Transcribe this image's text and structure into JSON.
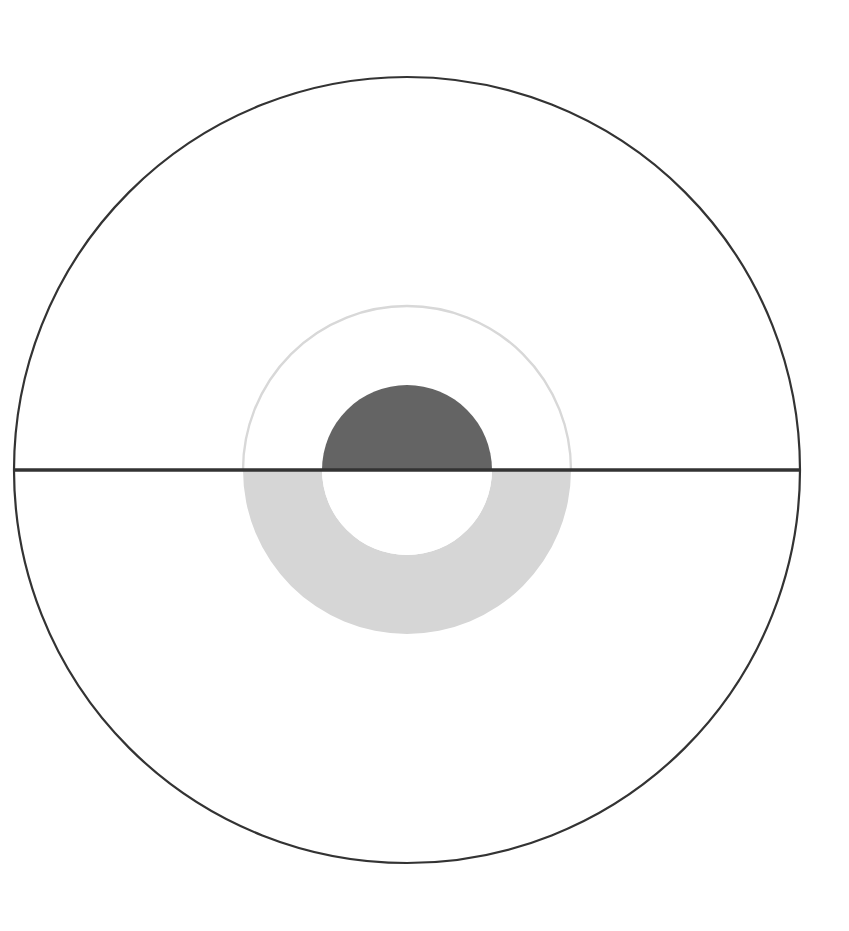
{
  "canvas": {
    "width": 849,
    "height": 931,
    "background": "#ffffff",
    "title": "Concentric circles with half-filled donut"
  },
  "chart_data": {
    "type": "pie",
    "title": "",
    "subtitle": "",
    "xlabel": "",
    "ylabel": "",
    "legend": [],
    "annotations": [],
    "grid": false,
    "center": {
      "x": 407,
      "y": 470
    },
    "series": [
      {
        "name": "outer-circle",
        "role": "outline",
        "radius": 393,
        "fill": "none",
        "stroke": "#333333",
        "stroke_width": 2.2,
        "half": "full"
      },
      {
        "name": "middle-circle-upper-outline",
        "role": "outline",
        "radius": 164,
        "fill": "none",
        "stroke": "#d8d8d8",
        "stroke_width": 2.4,
        "half": "upper"
      },
      {
        "name": "middle-annulus-lower-fill",
        "role": "fill",
        "outer_radius": 164,
        "inner_radius": 85,
        "fill": "#d6d6d6",
        "stroke": "none",
        "half": "lower"
      },
      {
        "name": "inner-circle-upper-fill",
        "role": "fill",
        "radius": 85,
        "fill": "#646464",
        "stroke": "none",
        "half": "upper"
      },
      {
        "name": "inner-circle-lower-hole",
        "role": "fill",
        "radius": 85,
        "fill": "#ffffff",
        "stroke": "none",
        "half": "lower"
      }
    ],
    "diameter_line": {
      "name": "horizontal-diameter",
      "x1": 14,
      "x2": 800,
      "y": 470,
      "stroke": "#333333",
      "stroke_width": 3.4
    },
    "values": [],
    "categories": []
  },
  "colors": {
    "outline_dark": "#333333",
    "fill_dark": "#646464",
    "fill_light": "#d6d6d6",
    "outline_light": "#d8d8d8",
    "background": "#ffffff"
  }
}
